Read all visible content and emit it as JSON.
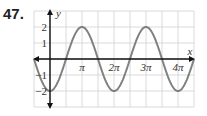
{
  "problem_number": "47.",
  "chart_data": {
    "type": "line",
    "title": "",
    "function": "y = -2cos(x)",
    "xlabel": "x",
    "ylabel": "y",
    "x_tick_labels": [
      "π",
      "2π",
      "3π",
      "4π"
    ],
    "y_tick_labels": [
      "2",
      "1",
      "-1",
      "-2"
    ],
    "xlim": [
      -0.5,
      4.5
    ],
    "ylim": [
      -3,
      3
    ],
    "x_unit": "π",
    "grid": true,
    "series": [
      {
        "name": "y = -2cos(x)",
        "x": [
          0,
          0.5,
          1,
          1.5,
          2,
          2.5,
          3,
          3.5,
          4
        ],
        "values": [
          -2,
          0,
          2,
          0,
          -2,
          0,
          2,
          0,
          -2
        ]
      }
    ],
    "colors": {
      "curve": "#808080",
      "axes": "#111111",
      "grid": "#d0d0d0"
    }
  }
}
